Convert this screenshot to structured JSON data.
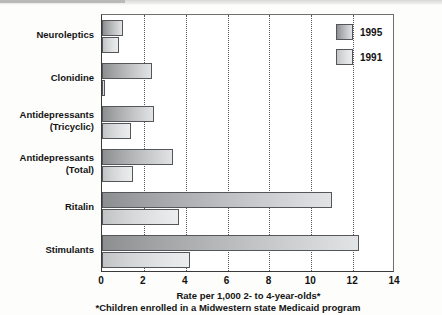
{
  "chart_data": {
    "type": "bar",
    "orientation": "horizontal",
    "title": "",
    "xlabel": "Rate per 1,000 2- to 4-year-olds*",
    "ylabel": "",
    "footnote": "*Children enrolled in a Midwestern state Medicaid program",
    "xlim": [
      0,
      14
    ],
    "xticks": [
      0,
      2,
      4,
      6,
      8,
      10,
      12,
      14
    ],
    "xtick_labels": [
      "0",
      "2",
      "4",
      "6",
      "8",
      "10",
      "12",
      "14"
    ],
    "grid": "vertical-dotted",
    "legend_position": "top-right",
    "categories": [
      "Neuroleptics",
      "Clonidine",
      "Antidepressants\n(Tricyclic)",
      "Antidepressants\n(Total)",
      "Ritalin",
      "Stimulants"
    ],
    "series": [
      {
        "name": "1995",
        "color": "#a8a9ab",
        "values": [
          1.0,
          2.4,
          2.5,
          3.4,
          11.0,
          12.3
        ]
      },
      {
        "name": "1991",
        "color": "#d8d9db",
        "values": [
          0.8,
          0.15,
          1.4,
          1.5,
          3.7,
          4.2
        ]
      }
    ]
  },
  "legend": {
    "items": [
      {
        "label": "1995"
      },
      {
        "label": "1991"
      }
    ]
  }
}
